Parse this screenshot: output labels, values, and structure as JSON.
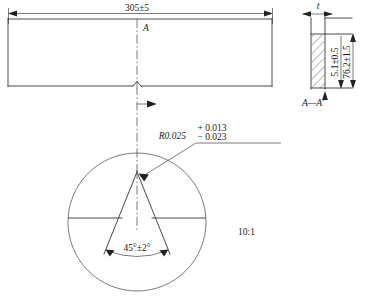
{
  "drawing": {
    "title": "Charpy V-notch impact test specimen drawing",
    "scale_note": "10:1",
    "section_label": "A—A′",
    "cut_plane_label": "A",
    "line_color": "#333333",
    "text_color": "#1a1a1a",
    "background": "#ffffff"
  },
  "main_view": {
    "name": "specimen-side-view",
    "length_dimension": "305±5",
    "cut_plane_label": "A",
    "notch_present": true
  },
  "detail_view": {
    "name": "notch-detail-circle",
    "scale": "10:1",
    "radius_callout": {
      "value": "R0.025",
      "tolerance_upper": "+ 0.013",
      "tolerance_lower": "− 0.023"
    },
    "angle_dimension": "45°±2°"
  },
  "section_view": {
    "name": "section-a-a",
    "label": "A—A′",
    "thickness_dimension": "t",
    "height_dimension_inner": "5.1±0.5",
    "height_dimension_outer": "76.2±1.5"
  }
}
